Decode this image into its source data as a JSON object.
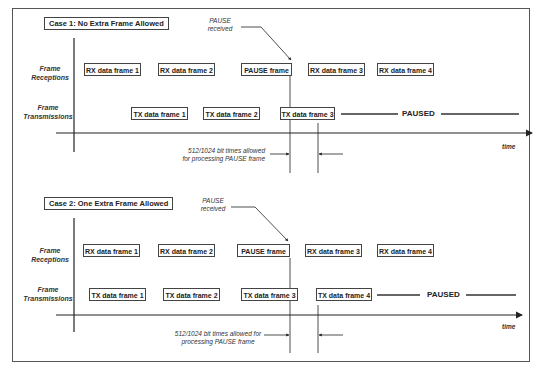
{
  "case1": {
    "title": "Case 1: No Extra Frame Allowed",
    "pause_label_line1": "PAUSE",
    "pause_label_line2": "received",
    "row_labels": {
      "rx_line1": "Frame",
      "rx_line2": "Receptions",
      "tx_line1": "Frame",
      "tx_line2": "Transmissions"
    },
    "rx_frames": [
      "RX data frame 1",
      "RX data frame 2",
      "PAUSE frame",
      "RX data frame 3",
      "RX data frame 4"
    ],
    "tx_frames": [
      "TX data frame 1",
      "TX data frame 2",
      "TX data frame 3"
    ],
    "paused_label": "PAUSED",
    "time_label": "time",
    "note_line1": "512/1024 bit times allowed",
    "note_line2": "for processing PAUSE frame"
  },
  "case2": {
    "title": "Case 2: One Extra Frame Allowed",
    "pause_label_line1": "PAUSE",
    "pause_label_line2": "received",
    "row_labels": {
      "rx_line1": "Frame",
      "rx_line2": "Receptions",
      "tx_line1": "Frame",
      "tx_line2": "Transmissions"
    },
    "rx_frames": [
      "RX data frame 1",
      "RX data frame 2",
      "PAUSE frame",
      "RX data frame 3",
      "RX data frame 4"
    ],
    "tx_frames": [
      "TX data frame 1",
      "TX data frame 2",
      "TX data frame 3",
      "TX data frame 4"
    ],
    "paused_label": "PAUSED",
    "time_label": "time",
    "note_line1": "512/1024 bit times allowed for",
    "note_line2": "processing PAUSE frame"
  }
}
